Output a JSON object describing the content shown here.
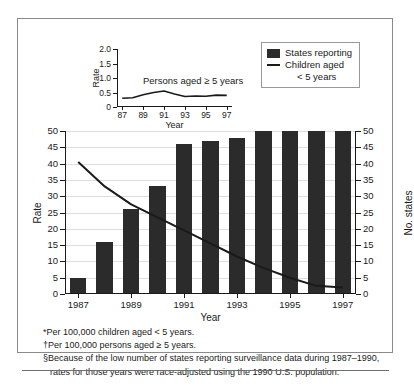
{
  "chart_data": {
    "type": "bar",
    "title": "",
    "xlabel": "Year",
    "ylabel": "Rate",
    "ylabel_right": "No. states",
    "ylim": [
      0,
      50
    ],
    "ylim_right": [
      0,
      50
    ],
    "grid": true,
    "legend_position": "top-right",
    "x": [
      1987,
      1988,
      1989,
      1990,
      1991,
      1992,
      1993,
      1994,
      1995,
      1996,
      1997
    ],
    "categories": [
      "1987",
      "1988",
      "1989",
      "1990",
      "1991",
      "1992",
      "1993",
      "1994",
      "1995",
      "1996",
      "1997"
    ],
    "tick_labels_x": [
      "1987",
      "1989",
      "1991",
      "1993",
      "1995",
      "1997"
    ],
    "tick_values_y": [
      0,
      5,
      10,
      15,
      20,
      25,
      30,
      35,
      40,
      45,
      50
    ],
    "tick_values_y_right": [
      0,
      5,
      10,
      15,
      20,
      25,
      30,
      35,
      40,
      45,
      50
    ],
    "series": [
      {
        "name": "States reporting",
        "type": "bar",
        "axis": "right",
        "values": [
          5,
          16,
          26,
          33,
          46,
          47,
          48,
          50,
          50,
          50,
          50
        ]
      },
      {
        "name": "Children aged < 5 years",
        "type": "line",
        "axis": "left",
        "values": [
          40.5,
          33.0,
          27.5,
          23.5,
          19.5,
          15.5,
          11.5,
          8.0,
          5.0,
          2.5,
          2.0
        ]
      }
    ],
    "inset": {
      "type": "line",
      "xlabel": "Year",
      "ylabel": "Rate",
      "ylim": [
        0,
        2.0
      ],
      "tick_values_y": [
        "0",
        "0.5",
        "1.0",
        "1.5",
        "2.0"
      ],
      "tick_labels_x": [
        "87",
        "89",
        "91",
        "93",
        "95",
        "97"
      ],
      "x": [
        1987,
        1988,
        1989,
        1990,
        1991,
        1992,
        1993,
        1994,
        1995,
        1996,
        1997
      ],
      "annotation": "Persons aged ≥ 5 years",
      "series": [
        {
          "name": "Persons aged ≥ 5 years",
          "values": [
            0.3,
            0.32,
            0.42,
            0.5,
            0.55,
            0.45,
            0.36,
            0.38,
            0.37,
            0.41,
            0.4
          ]
        }
      ]
    }
  },
  "legend": {
    "bar_label": "States reporting",
    "line_label_1": "Children aged",
    "line_label_2": "< 5 years"
  },
  "axes": {
    "left_title": "Rate",
    "right_title": "No. states",
    "x_title": "Year",
    "inset_y_title": "Rate",
    "inset_x_title": "Year"
  },
  "footnotes": {
    "line1": "*Per 100,000 children aged < 5 years.",
    "line2": "†Per 100,000 persons aged ≥ 5 years.",
    "line3": "§Because of the low number of states reporting surveillance data during 1987–1990,",
    "line4": "rates for those years were race-adjusted using the 1990 U.S. population."
  },
  "colors": {
    "bar": "#2b2b2b",
    "line": "#1a1a1a",
    "grid": "#dedede",
    "frame": "#8a8a8a"
  }
}
